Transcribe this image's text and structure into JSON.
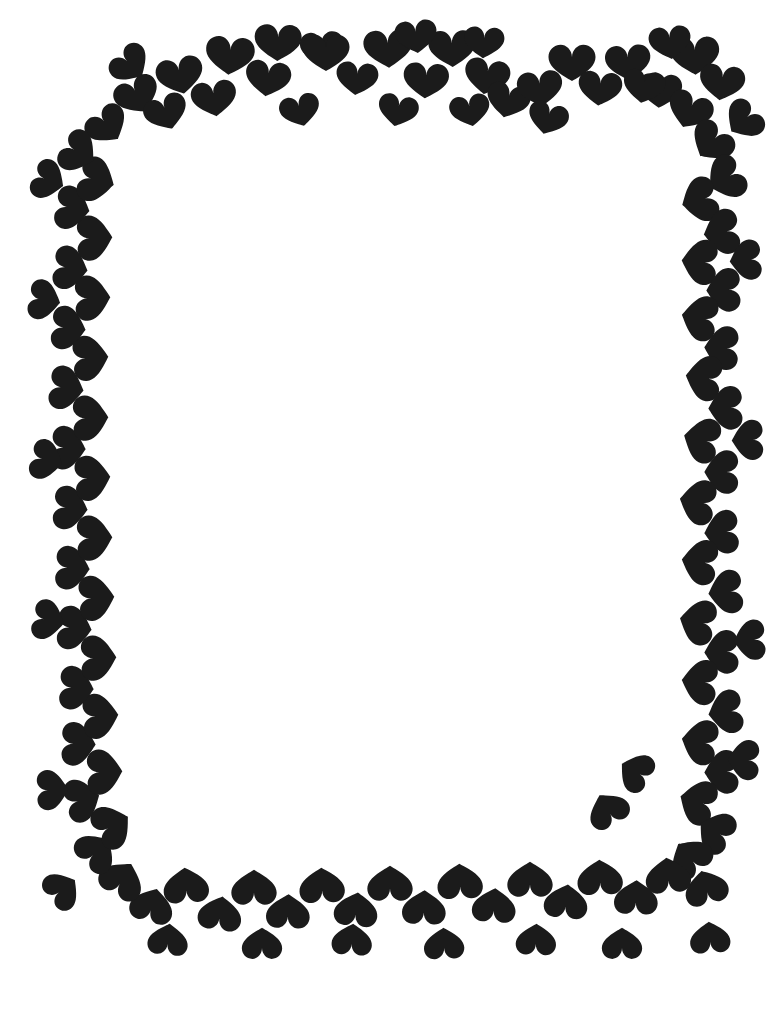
{
  "page": {
    "width": 784,
    "height": 1017,
    "background_color": "#ffffff",
    "motif_color": "#1b1b1b",
    "motif": "heart-shape"
  },
  "content": {
    "inner_area_label": "",
    "body_text": ""
  },
  "border": {
    "name": "heart-border",
    "shape_name": "heart-icon",
    "color": "#1b1b1b",
    "top_edge_label": "top-heart-row",
    "bottom_edge_label": "bottom-heart-row",
    "left_edge_label": "left-heart-column",
    "right_edge_label": "right-heart-column",
    "hearts": [
      {
        "x": 230,
        "y": 55,
        "s": 58,
        "r": 5
      },
      {
        "x": 180,
        "y": 75,
        "s": 56,
        "r": -12
      },
      {
        "x": 137,
        "y": 95,
        "s": 54,
        "r": -25
      },
      {
        "x": 107,
        "y": 125,
        "s": 52,
        "r": -38
      },
      {
        "x": 278,
        "y": 42,
        "s": 56,
        "r": 2
      },
      {
        "x": 322,
        "y": 48,
        "s": 52,
        "r": -4
      },
      {
        "x": 268,
        "y": 78,
        "s": 54,
        "r": 8
      },
      {
        "x": 214,
        "y": 98,
        "s": 54,
        "r": -8
      },
      {
        "x": 166,
        "y": 112,
        "s": 52,
        "r": -20
      },
      {
        "x": 326,
        "y": 52,
        "s": 56,
        "r": 0
      },
      {
        "x": 357,
        "y": 78,
        "s": 50,
        "r": 6
      },
      {
        "x": 388,
        "y": 48,
        "s": 58,
        "r": -3
      },
      {
        "x": 426,
        "y": 80,
        "s": 54,
        "r": 4
      },
      {
        "x": 452,
        "y": 48,
        "s": 56,
        "r": -2
      },
      {
        "x": 487,
        "y": 76,
        "s": 54,
        "r": 10
      },
      {
        "x": 508,
        "y": 100,
        "s": 52,
        "r": 14
      },
      {
        "x": 540,
        "y": 88,
        "s": 54,
        "r": -6
      },
      {
        "x": 572,
        "y": 62,
        "s": 56,
        "r": 0
      },
      {
        "x": 600,
        "y": 88,
        "s": 52,
        "r": 6
      },
      {
        "x": 628,
        "y": 62,
        "s": 54,
        "r": -4
      },
      {
        "x": 660,
        "y": 90,
        "s": 52,
        "r": 4
      },
      {
        "x": 695,
        "y": 55,
        "s": 58,
        "r": -2
      },
      {
        "x": 722,
        "y": 82,
        "s": 54,
        "r": 8
      },
      {
        "x": 690,
        "y": 110,
        "s": 54,
        "r": 22
      },
      {
        "x": 712,
        "y": 142,
        "s": 54,
        "r": 40
      },
      {
        "x": 726,
        "y": 178,
        "s": 54,
        "r": 60
      },
      {
        "x": 700,
        "y": 200,
        "s": 54,
        "r": 75
      },
      {
        "x": 722,
        "y": 232,
        "s": 54,
        "r": 82
      },
      {
        "x": 700,
        "y": 262,
        "s": 54,
        "r": 95
      },
      {
        "x": 724,
        "y": 290,
        "s": 52,
        "r": 88
      },
      {
        "x": 700,
        "y": 318,
        "s": 54,
        "r": 100
      },
      {
        "x": 722,
        "y": 348,
        "s": 52,
        "r": 92
      },
      {
        "x": 704,
        "y": 378,
        "s": 54,
        "r": 98
      },
      {
        "x": 726,
        "y": 408,
        "s": 52,
        "r": 88
      },
      {
        "x": 702,
        "y": 440,
        "s": 54,
        "r": 104
      },
      {
        "x": 722,
        "y": 472,
        "s": 52,
        "r": 90
      },
      {
        "x": 698,
        "y": 502,
        "s": 54,
        "r": 100
      },
      {
        "x": 722,
        "y": 532,
        "s": 52,
        "r": 86
      },
      {
        "x": 700,
        "y": 562,
        "s": 54,
        "r": 98
      },
      {
        "x": 726,
        "y": 592,
        "s": 52,
        "r": 84
      },
      {
        "x": 698,
        "y": 622,
        "s": 54,
        "r": 102
      },
      {
        "x": 722,
        "y": 652,
        "s": 52,
        "r": 88
      },
      {
        "x": 700,
        "y": 682,
        "s": 54,
        "r": 96
      },
      {
        "x": 726,
        "y": 712,
        "s": 52,
        "r": 82
      },
      {
        "x": 700,
        "y": 742,
        "s": 54,
        "r": 100
      },
      {
        "x": 722,
        "y": 772,
        "s": 52,
        "r": 88
      },
      {
        "x": 698,
        "y": 802,
        "s": 54,
        "r": 108
      },
      {
        "x": 716,
        "y": 832,
        "s": 52,
        "r": 120
      },
      {
        "x": 690,
        "y": 858,
        "s": 54,
        "r": 140
      },
      {
        "x": 706,
        "y": 888,
        "s": 52,
        "r": 165
      },
      {
        "x": 668,
        "y": 876,
        "s": 54,
        "r": 175
      },
      {
        "x": 636,
        "y": 898,
        "s": 52,
        "r": 182
      },
      {
        "x": 600,
        "y": 878,
        "s": 54,
        "r": 178
      },
      {
        "x": 566,
        "y": 902,
        "s": 52,
        "r": 186
      },
      {
        "x": 530,
        "y": 880,
        "s": 54,
        "r": 180
      },
      {
        "x": 494,
        "y": 906,
        "s": 52,
        "r": 184
      },
      {
        "x": 460,
        "y": 882,
        "s": 54,
        "r": 178
      },
      {
        "x": 424,
        "y": 908,
        "s": 52,
        "r": 182
      },
      {
        "x": 390,
        "y": 884,
        "s": 54,
        "r": 180
      },
      {
        "x": 356,
        "y": 910,
        "s": 52,
        "r": 186
      },
      {
        "x": 322,
        "y": 886,
        "s": 54,
        "r": 178
      },
      {
        "x": 288,
        "y": 912,
        "s": 52,
        "r": 182
      },
      {
        "x": 254,
        "y": 888,
        "s": 54,
        "r": 180
      },
      {
        "x": 220,
        "y": 914,
        "s": 52,
        "r": 188
      },
      {
        "x": 186,
        "y": 886,
        "s": 54,
        "r": 176
      },
      {
        "x": 152,
        "y": 906,
        "s": 52,
        "r": 196
      },
      {
        "x": 122,
        "y": 880,
        "s": 54,
        "r": 210
      },
      {
        "x": 96,
        "y": 852,
        "s": 52,
        "r": 225
      },
      {
        "x": 112,
        "y": 826,
        "s": 54,
        "r": 240
      },
      {
        "x": 82,
        "y": 800,
        "s": 52,
        "r": 255
      },
      {
        "x": 104,
        "y": 772,
        "s": 54,
        "r": 268
      },
      {
        "x": 78,
        "y": 744,
        "s": 52,
        "r": 272
      },
      {
        "x": 100,
        "y": 716,
        "s": 54,
        "r": 266
      },
      {
        "x": 76,
        "y": 688,
        "s": 52,
        "r": 274
      },
      {
        "x": 98,
        "y": 658,
        "s": 54,
        "r": 268
      },
      {
        "x": 74,
        "y": 628,
        "s": 52,
        "r": 276
      },
      {
        "x": 96,
        "y": 598,
        "s": 54,
        "r": 266
      },
      {
        "x": 72,
        "y": 568,
        "s": 52,
        "r": 274
      },
      {
        "x": 94,
        "y": 538,
        "s": 54,
        "r": 268
      },
      {
        "x": 70,
        "y": 508,
        "s": 52,
        "r": 276
      },
      {
        "x": 92,
        "y": 478,
        "s": 54,
        "r": 266
      },
      {
        "x": 68,
        "y": 448,
        "s": 52,
        "r": 274
      },
      {
        "x": 90,
        "y": 418,
        "s": 54,
        "r": 268
      },
      {
        "x": 66,
        "y": 388,
        "s": 52,
        "r": 278
      },
      {
        "x": 90,
        "y": 358,
        "s": 54,
        "r": 266
      },
      {
        "x": 68,
        "y": 328,
        "s": 52,
        "r": 276
      },
      {
        "x": 92,
        "y": 298,
        "s": 54,
        "r": 268
      },
      {
        "x": 70,
        "y": 268,
        "s": 52,
        "r": 278
      },
      {
        "x": 94,
        "y": 238,
        "s": 54,
        "r": 268
      },
      {
        "x": 72,
        "y": 208,
        "s": 52,
        "r": 280
      },
      {
        "x": 96,
        "y": 180,
        "s": 54,
        "r": 285
      },
      {
        "x": 78,
        "y": 152,
        "s": 52,
        "r": 300
      },
      {
        "x": 644,
        "y": 86,
        "s": 50,
        "r": 10
      },
      {
        "x": 548,
        "y": 118,
        "s": 48,
        "r": 16
      },
      {
        "x": 470,
        "y": 110,
        "s": 48,
        "r": -10
      },
      {
        "x": 398,
        "y": 110,
        "s": 48,
        "r": 12
      },
      {
        "x": 300,
        "y": 110,
        "s": 48,
        "r": -14
      },
      {
        "x": 744,
        "y": 120,
        "s": 50,
        "r": 48
      },
      {
        "x": 746,
        "y": 260,
        "s": 48,
        "r": 85
      },
      {
        "x": 748,
        "y": 440,
        "s": 48,
        "r": 88
      },
      {
        "x": 750,
        "y": 640,
        "s": 48,
        "r": 86
      },
      {
        "x": 744,
        "y": 760,
        "s": 48,
        "r": 92
      },
      {
        "x": 48,
        "y": 180,
        "s": 48,
        "r": 292
      },
      {
        "x": 44,
        "y": 300,
        "s": 48,
        "r": 280
      },
      {
        "x": 46,
        "y": 460,
        "s": 48,
        "r": 284
      },
      {
        "x": 48,
        "y": 620,
        "s": 48,
        "r": 282
      },
      {
        "x": 52,
        "y": 790,
        "s": 48,
        "r": 268
      },
      {
        "x": 62,
        "y": 890,
        "s": 48,
        "r": 232
      },
      {
        "x": 168,
        "y": 940,
        "s": 48,
        "r": 186
      },
      {
        "x": 262,
        "y": 944,
        "s": 48,
        "r": 180
      },
      {
        "x": 352,
        "y": 940,
        "s": 48,
        "r": 184
      },
      {
        "x": 444,
        "y": 944,
        "s": 48,
        "r": 178
      },
      {
        "x": 536,
        "y": 940,
        "s": 48,
        "r": 182
      },
      {
        "x": 622,
        "y": 944,
        "s": 48,
        "r": 180
      },
      {
        "x": 710,
        "y": 938,
        "s": 48,
        "r": 176
      },
      {
        "x": 608,
        "y": 810,
        "s": 50,
        "r": 150
      },
      {
        "x": 636,
        "y": 772,
        "s": 48,
        "r": 120
      },
      {
        "x": 130,
        "y": 64,
        "s": 50,
        "r": -45
      },
      {
        "x": 416,
        "y": 36,
        "s": 50,
        "r": -6
      },
      {
        "x": 484,
        "y": 42,
        "s": 48,
        "r": 4
      },
      {
        "x": 670,
        "y": 42,
        "s": 50,
        "r": -6
      }
    ]
  }
}
